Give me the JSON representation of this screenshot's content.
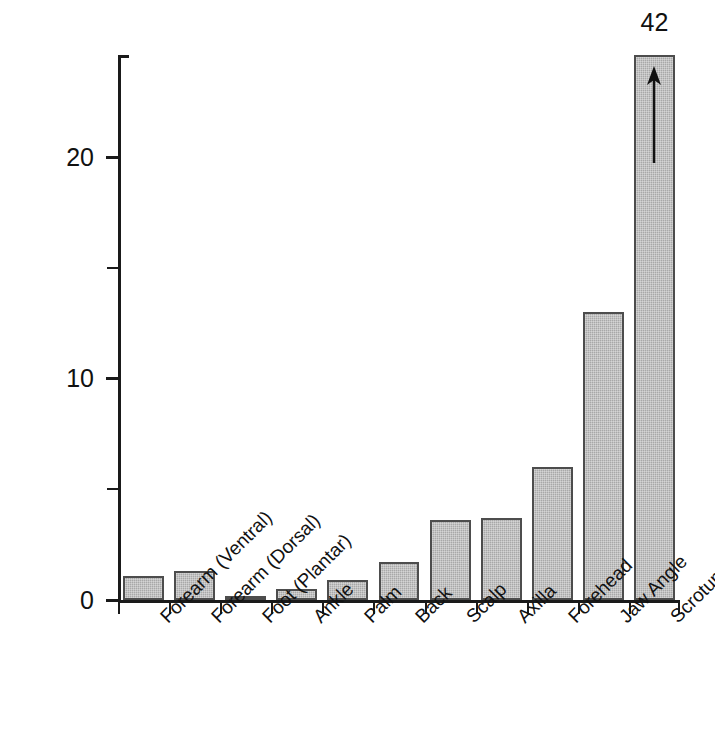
{
  "chart_data": {
    "type": "bar",
    "title": "",
    "subtitle": "",
    "xlabel": "",
    "ylabel": "Relative hydrocortisone absorption",
    "ylim": [
      0,
      24.6
    ],
    "grid": false,
    "legend": null,
    "y_major_ticks": [
      0,
      10,
      20
    ],
    "y_major_tick_labels": [
      "0",
      "10",
      "20"
    ],
    "y_minor_ticks": [
      5,
      15
    ],
    "categories": [
      "Forearm (Ventral)",
      "Forearm (Dorsal)",
      "Foot (Plantar)",
      "Ankle",
      "Palm",
      "Back",
      "Scalp",
      "Axilla",
      "Forehead",
      "Jaw Angle",
      "Scrotum"
    ],
    "values": [
      1.1,
      1.3,
      0.2,
      0.5,
      0.9,
      1.7,
      3.6,
      3.7,
      6.0,
      13.0,
      42
    ],
    "annotations": [
      {
        "category": "Scrotum",
        "text": "42",
        "marker": "up-arrow",
        "note": "bar truncated at axis top; true value printed above bar"
      }
    ]
  },
  "colors": {
    "bar_fill": "#a8a8a8",
    "bar_stroke": "#4d4d4d",
    "axis": "#1a1a1a",
    "text": "#111111",
    "background": "#ffffff"
  }
}
